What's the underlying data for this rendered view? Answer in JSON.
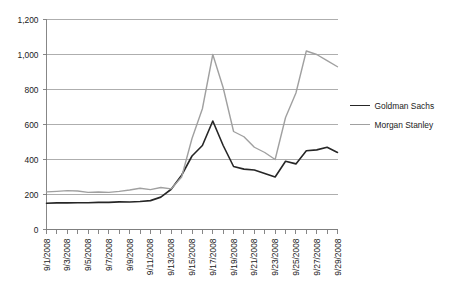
{
  "chart_data": {
    "type": "line",
    "title": "",
    "subtitle": "",
    "xlabel": "",
    "ylabel": "",
    "grid": true,
    "legend_position": "right",
    "ylim": [
      0,
      1200
    ],
    "y_ticks": [
      "0",
      "200",
      "400",
      "600",
      "800",
      "1,000",
      "1,200"
    ],
    "y_tick_values": [
      0,
      200,
      400,
      600,
      800,
      1000,
      1200
    ],
    "x": [
      "9/1/2008",
      "9/2/2008",
      "9/3/2008",
      "9/4/2008",
      "9/5/2008",
      "9/6/2008",
      "9/7/2008",
      "9/8/2008",
      "9/9/2008",
      "9/10/2008",
      "9/11/2008",
      "9/12/2008",
      "9/13/2008",
      "9/14/2008",
      "9/15/2008",
      "9/16/2008",
      "9/17/2008",
      "9/18/2008",
      "9/19/2008",
      "9/20/2008",
      "9/21/2008",
      "9/22/2008",
      "9/23/2008",
      "9/24/2008",
      "9/25/2008",
      "9/26/2008",
      "9/27/2008",
      "9/28/2008",
      "9/29/2008"
    ],
    "x_tick_labels": [
      "9/1/2008",
      "9/3/2008",
      "9/5/2008",
      "9/7/2008",
      "9/9/2008",
      "9/11/2008",
      "9/13/2008",
      "9/15/2008",
      "9/17/2008",
      "9/19/2008",
      "9/21/2008",
      "9/23/2008",
      "9/25/2008",
      "9/27/2008",
      "9/29/2008"
    ],
    "x_tick_indices": [
      0,
      2,
      4,
      6,
      8,
      10,
      12,
      14,
      16,
      18,
      20,
      22,
      24,
      26,
      28
    ],
    "series": [
      {
        "name": "Goldman Sachs",
        "color": "#262626",
        "width": 1.6,
        "values": [
          150,
          152,
          152,
          153,
          153,
          155,
          155,
          158,
          157,
          160,
          165,
          185,
          230,
          310,
          420,
          480,
          620,
          480,
          360,
          345,
          340,
          320,
          300,
          390,
          375,
          450,
          455,
          470,
          440
        ]
      },
      {
        "name": "Morgan Stanley",
        "color": "#a0a0a0",
        "width": 1.4,
        "values": [
          215,
          218,
          222,
          220,
          212,
          214,
          212,
          218,
          226,
          236,
          228,
          240,
          232,
          300,
          520,
          690,
          1000,
          810,
          560,
          530,
          470,
          440,
          400,
          640,
          780,
          1020,
          1000,
          965,
          930
        ]
      }
    ]
  },
  "legend": {
    "items": [
      {
        "label": "Goldman Sachs",
        "color": "#262626"
      },
      {
        "label": "Morgan Stanley",
        "color": "#a0a0a0"
      }
    ]
  }
}
